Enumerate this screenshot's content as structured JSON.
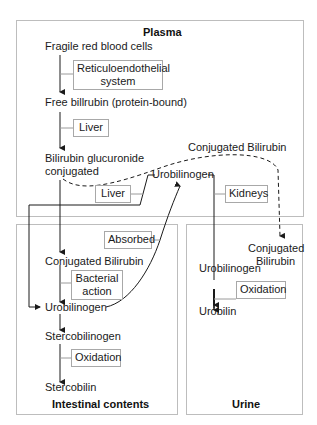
{
  "regions": {
    "plasma": {
      "title": "Plasma"
    },
    "intestinal": {
      "title": "Intestinal contents"
    },
    "urine": {
      "title": "Urine"
    }
  },
  "nodes": {
    "fragile_rbc": "Fragile red blood cells",
    "free_bilirubin": "Free billrubin (protein-bound)",
    "glucuronide_line1": "Bilirubin glucuronide",
    "glucuronide_line2": "conjugated",
    "conjugated_bilirubin_plasma": "Conjugated Bilirubin",
    "urobilinogen_plasma": "Urobilinogen",
    "conjugated_bilirubin_intestine": "Conjugated Bilirubin",
    "urobilinogen_intestine": "Urobilinogen",
    "stercobilinogen": "Stercobilinogen",
    "stercobilin": "Stercobilin",
    "conjugated_bilirubin_urine_line1": "Conjugated",
    "conjugated_bilirubin_urine_line2": "Bilirubin",
    "urobilinogen_urine": "Urobilinogen",
    "urobilin": "Urobilin"
  },
  "process_tags": {
    "reticuloendothelial_line1": "Reticuloendothelial",
    "reticuloendothelial_line2": "system",
    "liver_1": "Liver",
    "liver_2": "Liver",
    "kidneys": "Kidneys",
    "absorbed": "Absorbed",
    "bacterial_line1": "Bacterial",
    "bacterial_line2": "action",
    "oxidation_intestine": "Oxidation",
    "oxidation_urine": "Oxidation"
  },
  "colors": {
    "region_border": "#bdbdbd",
    "tag_border": "#a8a8a8",
    "line": "#1a1a1a",
    "connector": "#9a9a9a"
  }
}
